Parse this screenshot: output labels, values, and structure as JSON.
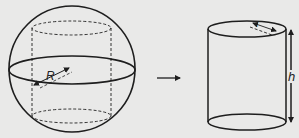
{
  "diagram": {
    "type": "geometry-transformation",
    "colors": {
      "background": "#e9e9e8",
      "stroke": "#1e1e1e"
    },
    "sphere": {
      "radius_label": "R"
    },
    "transform_arrow": {
      "direction": "right"
    },
    "cylinder": {
      "radius_label": "r",
      "height_label": "h"
    }
  }
}
